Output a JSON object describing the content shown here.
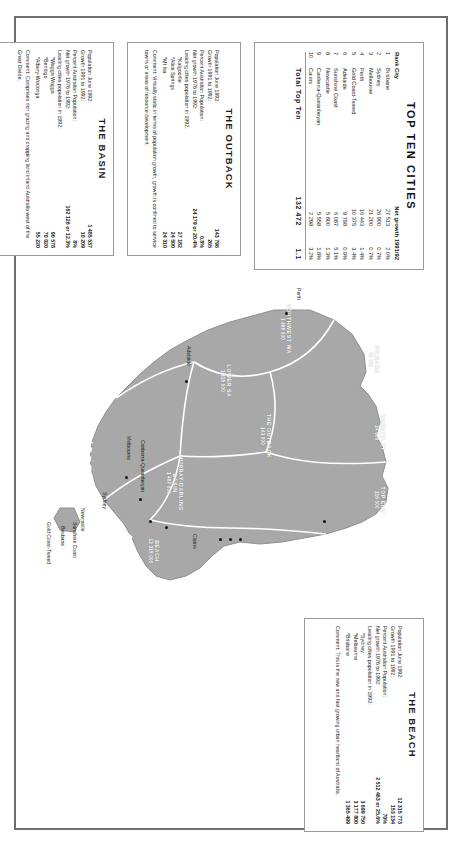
{
  "poster": {
    "title": "Australia population regions",
    "rotation_deg": 90
  },
  "top_ten": {
    "title": "TOP TEN CITIES",
    "columns": [
      "Rank",
      "City",
      "Net growth 1991/92",
      ""
    ],
    "col_rank": "Rank",
    "col_city": "City",
    "col_net": "Net growth 1991/92",
    "rows": [
      {
        "rank": "1",
        "city": "Brisbane",
        "net": "27 513",
        "pct": "2.0%"
      },
      {
        "rank": "2",
        "city": "Sydney",
        "net": "26 900",
        "pct": "0.7%"
      },
      {
        "rank": "3",
        "city": "Melbourne",
        "net": "21 200",
        "pct": "0.7%"
      },
      {
        "rank": "4",
        "city": "Perth",
        "net": "16 443",
        "pct": "1.4%"
      },
      {
        "rank": "5",
        "city": "Gold Coast-Tweed",
        "net": "10 375",
        "pct": "3.4%"
      },
      {
        "rank": "6",
        "city": "Adelaide",
        "net": "9 798",
        "pct": "0.9%"
      },
      {
        "rank": "7",
        "city": "Sunshine Coast",
        "net": "6 087",
        "pct": "5.1%"
      },
      {
        "rank": "8",
        "city": "Newcastle",
        "net": "5 800",
        "pct": "1.3%"
      },
      {
        "rank": "9",
        "city": "Canberra-Queanbeyan",
        "net": "5 558",
        "pct": "1.8%"
      },
      {
        "rank": "10",
        "city": "Cairns",
        "net": "2 298",
        "pct": "3.2%"
      }
    ],
    "total_label": "Total Top Ten",
    "total_net": "132 472",
    "total_pct": "1.1"
  },
  "panels": {
    "outback": {
      "title": "THE OUTBACK",
      "stats": [
        {
          "label": "Population June 1992:",
          "value": "143 796"
        },
        {
          "label": "Growth 1991 to 1992:",
          "value": "265"
        },
        {
          "label": "Percent Australian Population:",
          "value": "0.8%"
        },
        {
          "label": "Net growth 1976 to 1992:",
          "value": "24 179 or 20.4%"
        },
        {
          "label": "Leading cities population in 1992:",
          "value": ""
        }
      ],
      "cities": [
        {
          "label": "*Kalgoorlie",
          "value": "27 182"
        },
        {
          "label": "*Alice Springs",
          "value": "24 500"
        },
        {
          "label": "*Mt Isa",
          "value": "24 310"
        }
      ],
      "comment": "Comment: Virtually static in terms of population growth, growth is confined to service towns or areas of resource development."
    },
    "basin": {
      "title": "THE BASIN",
      "stats": [
        {
          "label": "Population June 1992:",
          "value": "1 485 537"
        },
        {
          "label": "Growth 1991 to 1992:",
          "value": "10 209"
        },
        {
          "label": "Percent Australian Population:",
          "value": "8%"
        },
        {
          "label": "Net growth 1976 to 1992:",
          "value": "162 126 or 12.3%"
        },
        {
          "label": "Leading cities population in 1992:",
          "value": ""
        }
      ],
      "cities": [
        {
          "label": "*Wagga Wagga",
          "value": "90 578"
        },
        {
          "label": "*Bendigo",
          "value": "70 020"
        },
        {
          "label": "*Albury-Wodonga",
          "value": "55 220"
        }
      ],
      "comment": "Comment: Comprises rich grazing and cropping land inland Australia west of the Great Divide."
    },
    "beach": {
      "title": "THE BEACH",
      "stats": [
        {
          "label": "Population June 1992:",
          "value": "12 315 773"
        },
        {
          "label": "Growth 1991 to 1992:",
          "value": "153 134"
        },
        {
          "label": "Percent Australian Population:",
          "value": "70%"
        },
        {
          "label": "Net growth 1976 to 1992:",
          "value": "2 512 463 or 25.6%"
        },
        {
          "label": "Leading cities population in 1992:",
          "value": ""
        }
      ],
      "cities": [
        {
          "label": "*Sydney",
          "value": "3 699 750"
        },
        {
          "label": "*Melbourne",
          "value": "3 177 800"
        },
        {
          "label": "*Brisbane",
          "value": "1 365 499"
        }
      ],
      "comment": "Comment: This is the new and fast growing urban heartland of Australia."
    }
  },
  "map": {
    "regions": [
      {
        "name": "SOUTHWEST WA",
        "value": "1 368 000"
      },
      {
        "name": "PILBARA",
        "value": "46 600"
      },
      {
        "name": "KIMBERLEY",
        "value": "24 600"
      },
      {
        "name": "TOP END",
        "value": "116 000"
      },
      {
        "name": "THE OUTBACK",
        "value": "143 000"
      },
      {
        "name": "LOWER SA",
        "value": "1 315 000"
      },
      {
        "name": "MURRAY-DARLING BASIN",
        "value": "1 487 000"
      },
      {
        "name": "BEACH",
        "value": "12 315 000"
      }
    ],
    "cities": [
      {
        "name": "Perth"
      },
      {
        "name": "Adelaide"
      },
      {
        "name": "Melbourne"
      },
      {
        "name": "Canberra-Queanbeyan"
      },
      {
        "name": "Sydney"
      },
      {
        "name": "Newcastle"
      },
      {
        "name": "Brisbane"
      },
      {
        "name": "Gold Coast-Tweed"
      },
      {
        "name": "Sunshine Coast"
      },
      {
        "name": "Cairns"
      }
    ]
  }
}
